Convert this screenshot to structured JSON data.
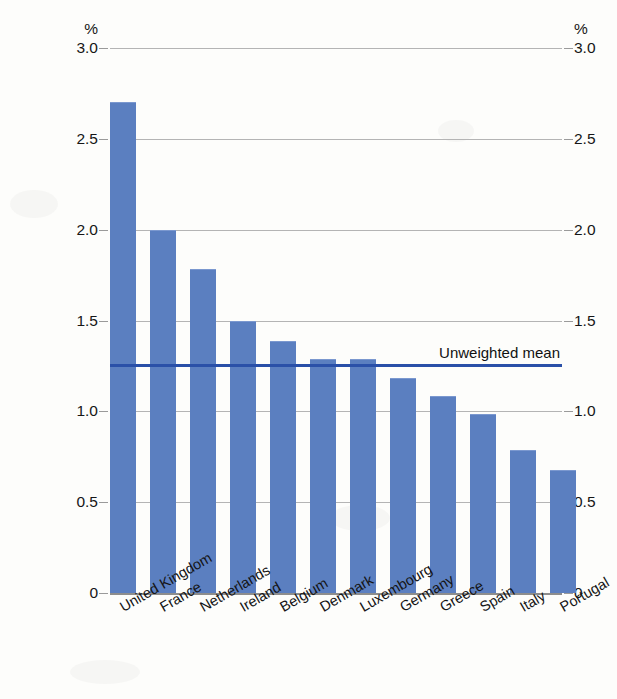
{
  "chart_data": {
    "type": "bar",
    "title": "",
    "subtitle": "",
    "xlabel": "",
    "ylabel": "",
    "unit_symbol": "%",
    "ylim": [
      0,
      3.0
    ],
    "ytick_labels": [
      "3.0",
      "2.5",
      "2.0",
      "1.5",
      "1.0",
      "0.5",
      "0"
    ],
    "ytick_values": [
      3.0,
      2.5,
      2.0,
      1.5,
      1.0,
      0.5,
      0
    ],
    "grid": true,
    "legend": "none",
    "dual_axis": true,
    "categories": [
      "United Kingdom",
      "France",
      "Netherlands",
      "Ireland",
      "Belgium",
      "Denmark",
      "Luxembourg",
      "Germany",
      "Greece",
      "Spain",
      "Italy",
      "Portugal"
    ],
    "values": [
      2.7,
      1.99,
      1.78,
      1.49,
      1.38,
      1.28,
      1.28,
      1.18,
      1.08,
      0.98,
      0.78,
      0.67
    ],
    "annotations": [
      {
        "name": "unweighted-mean",
        "label": "Unweighted mean",
        "value": 1.25,
        "style": "horizontal-line",
        "color": "#2a50a8"
      }
    ],
    "colors": {
      "bar_fill": "#5b7fc0",
      "mean_line": "#2a50a8",
      "gridline": "#b4b4b4",
      "baseline": "#8d8d8d",
      "background": "#fdfdfb",
      "text": "#161616"
    }
  }
}
